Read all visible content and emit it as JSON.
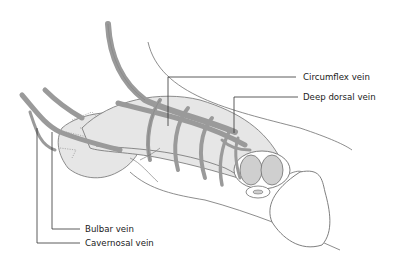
{
  "diagram": {
    "labels": [
      {
        "id": "circumflex",
        "text": "Circumflex vein"
      },
      {
        "id": "deep_dorsal",
        "text": "Deep dorsal vein"
      },
      {
        "id": "bulbar",
        "text": "Bulbar vein"
      },
      {
        "id": "cavernosal",
        "text": "Cavernosal vein"
      }
    ],
    "colors": {
      "vein_fill": "#9a9a9a",
      "vein_stroke": "#6e6e6e",
      "tissue_fill": "#e6e6e6",
      "corpora_fill": "#cfcfcf",
      "outline": "#707070",
      "leader_line": "#333333",
      "background": "#ffffff"
    }
  }
}
